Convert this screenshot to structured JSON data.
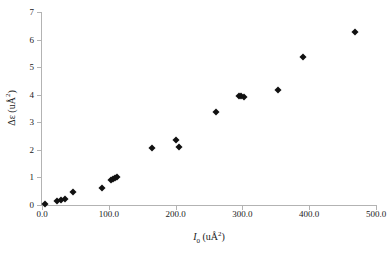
{
  "chart_data": {
    "type": "scatter",
    "title": "",
    "xlabel": "I0 (uÅ²)",
    "ylabel": "Δε (uÅ²)",
    "xlim": [
      0,
      500
    ],
    "ylim": [
      0,
      7
    ],
    "grid": false,
    "legend": null,
    "marker": "diamond",
    "marker_color": "#111111",
    "axis_color": "#b3b3b3",
    "xticks": [
      0,
      100,
      200,
      300,
      400,
      500
    ],
    "xtick_labels": [
      "0.0",
      "100.0",
      "200.0",
      "300.0",
      "400.0",
      "500.0"
    ],
    "yticks": [
      0,
      1,
      2,
      3,
      4,
      5,
      6,
      7
    ],
    "ytick_labels": [
      "0",
      "1",
      "2",
      "3",
      "4",
      "5",
      "6",
      "7"
    ],
    "points": [
      {
        "x": 4,
        "y": 0.03
      },
      {
        "x": 23,
        "y": 0.14
      },
      {
        "x": 28,
        "y": 0.17
      },
      {
        "x": 34,
        "y": 0.21
      },
      {
        "x": 46,
        "y": 0.47
      },
      {
        "x": 90,
        "y": 0.63
      },
      {
        "x": 104,
        "y": 0.9
      },
      {
        "x": 107,
        "y": 0.93
      },
      {
        "x": 110,
        "y": 0.97
      },
      {
        "x": 112,
        "y": 1.03
      },
      {
        "x": 165,
        "y": 2.05
      },
      {
        "x": 201,
        "y": 2.35
      },
      {
        "x": 205,
        "y": 2.12
      },
      {
        "x": 261,
        "y": 3.38
      },
      {
        "x": 295,
        "y": 3.97
      },
      {
        "x": 298,
        "y": 3.94
      },
      {
        "x": 302,
        "y": 3.9
      },
      {
        "x": 354,
        "y": 4.18
      },
      {
        "x": 390,
        "y": 5.38
      },
      {
        "x": 468,
        "y": 6.28
      }
    ]
  },
  "axis_titles": {
    "x_symbol": "I",
    "x_sub": "0",
    "x_unit_open": " (uÅ",
    "x_sup": "2",
    "x_unit_close": ")",
    "y_symbol": "Δε",
    "y_unit_open": " (uÅ",
    "y_sup": "2",
    "y_unit_close": ")"
  }
}
